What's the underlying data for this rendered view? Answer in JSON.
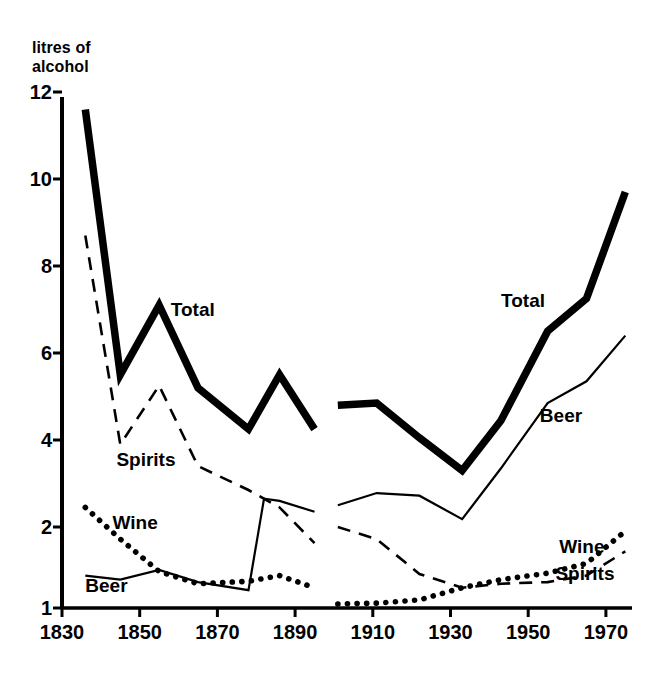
{
  "chart_data": {
    "type": "line",
    "title": "",
    "subtitle": "",
    "ylabel": "litres of\nalcohol",
    "ylabel_line1": "litres of",
    "ylabel_line2": "alcohol",
    "xlabel": "",
    "yticks": [
      1,
      2,
      4,
      6,
      8,
      10,
      12
    ],
    "ytick_labels": [
      "1",
      "2",
      "4",
      "6",
      "8",
      "10",
      "12"
    ],
    "xticks": [
      1830,
      1850,
      1870,
      1890,
      1910,
      1930,
      1950,
      1970
    ],
    "xtick_labels": [
      "1830",
      "1850",
      "1870",
      "1890",
      "1910",
      "1930",
      "1950",
      "1970"
    ],
    "xlim": [
      1830,
      1978
    ],
    "ylim": [
      1,
      12
    ],
    "grid": false,
    "legend": "inline-annotations",
    "note": "Y axis is broken/compressed between 1 and 2; above 2 the spacing is linear. Data is split into two eras with a gap between 1895 and 1901.",
    "annotations": [
      {
        "text": "Total",
        "x": 1858,
        "y": 7.0,
        "panel": "left"
      },
      {
        "text": "Spirits",
        "x": 1844,
        "y": 3.55,
        "panel": "left"
      },
      {
        "text": "Wine",
        "x": 1843,
        "y": 2.1,
        "panel": "left"
      },
      {
        "text": "Beer",
        "x": 1836,
        "y": 1.27,
        "panel": "left"
      },
      {
        "text": "Total",
        "x": 1943,
        "y": 7.2,
        "panel": "right"
      },
      {
        "text": "Beer",
        "x": 1953,
        "y": 4.55,
        "panel": "right"
      },
      {
        "text": "Wine",
        "x": 1958,
        "y": 1.75,
        "panel": "right"
      },
      {
        "text": "Spirits",
        "x": 1957,
        "y": 1.42,
        "panel": "right"
      }
    ],
    "series": [
      {
        "name": "Total",
        "style": "thick-solid",
        "color": "#000000",
        "segments": [
          {
            "panel": "left",
            "x": [
              1836,
              1845,
              1855,
              1865,
              1878,
              1886,
              1895
            ],
            "values": [
              11.6,
              5.5,
              7.1,
              5.2,
              4.25,
              5.5,
              4.25
            ]
          },
          {
            "panel": "right",
            "x": [
              1901,
              1911,
              1922,
              1933,
              1943,
              1955,
              1965,
              1975
            ],
            "values": [
              4.8,
              4.85,
              4.05,
              3.3,
              4.45,
              6.5,
              7.25,
              9.7
            ]
          }
        ]
      },
      {
        "name": "Spirits",
        "style": "dashed",
        "color": "#000000",
        "segments": [
          {
            "panel": "left",
            "x": [
              1836,
              1845,
              1855,
              1865,
              1878,
              1886,
              1895
            ],
            "values": [
              8.7,
              3.9,
              5.25,
              3.4,
              2.85,
              2.45,
              1.8
            ]
          },
          {
            "panel": "right",
            "x": [
              1901,
              1911,
              1922,
              1933,
              1943,
              1955,
              1965,
              1975
            ],
            "values": [
              2.0,
              1.85,
              1.42,
              1.25,
              1.3,
              1.32,
              1.4,
              1.7
            ]
          }
        ]
      },
      {
        "name": "Wine",
        "style": "dotted",
        "color": "#000000",
        "segments": [
          {
            "panel": "left",
            "x": [
              1836,
              1845,
              1855,
              1865,
              1878,
              1886,
              1895
            ],
            "values": [
              2.45,
              1.85,
              1.45,
              1.3,
              1.33,
              1.4,
              1.25
            ]
          },
          {
            "panel": "right",
            "x": [
              1901,
              1911,
              1922,
              1933,
              1943,
              1955,
              1965,
              1975
            ],
            "values": [
              1.05,
              1.06,
              1.1,
              1.25,
              1.35,
              1.43,
              1.55,
              1.95
            ]
          }
        ]
      },
      {
        "name": "Beer",
        "style": "thin-solid",
        "color": "#000000",
        "segments": [
          {
            "panel": "left",
            "x": [
              1836,
              1845,
              1855,
              1865,
              1878,
              1882,
              1886,
              1895
            ],
            "values": [
              1.4,
              1.35,
              1.47,
              1.32,
              1.22,
              2.65,
              2.6,
              2.35
            ]
          },
          {
            "panel": "right",
            "x": [
              1901,
              1911,
              1922,
              1933,
              1943,
              1955,
              1965,
              1975
            ],
            "values": [
              2.5,
              2.78,
              2.72,
              2.18,
              3.35,
              4.85,
              5.35,
              6.4
            ]
          }
        ]
      }
    ]
  }
}
